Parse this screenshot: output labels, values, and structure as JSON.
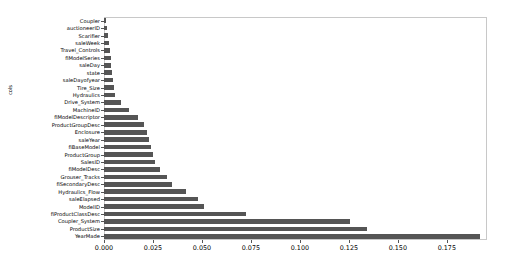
{
  "chart_data": {
    "type": "bar",
    "orientation": "horizontal",
    "title": "",
    "xlabel": "",
    "ylabel": "cols",
    "xlim": [
      0.0,
      0.1955
    ],
    "xticks": [
      0.0,
      0.025,
      0.05,
      0.075,
      0.1,
      0.125,
      0.15,
      0.175
    ],
    "xticklabels": [
      "0.000",
      "0.025",
      "0.050",
      "0.075",
      "0.100",
      "0.125",
      "0.150",
      "0.175"
    ],
    "grid": false,
    "legend": null,
    "bar_color": "#555555",
    "frame_color": "#c8c8c8",
    "categories": [
      "Coupler",
      "auctioneerID",
      "Scarifier",
      "saleWeek",
      "Travel_Controls",
      "fiModelSeries",
      "saleDay",
      "state",
      "saleDayofyear",
      "Tire_Size",
      "Hydraulics",
      "Drive_System",
      "MachineID",
      "fiModelDescriptor",
      "ProductGroupDesc",
      "Enclosure",
      "saleYear",
      "fiBaseModel",
      "ProductGroup",
      "SalesID",
      "fiModelDesc",
      "Grouser_Tracks",
      "fiSecondaryDesc",
      "Hydraulics_Flow",
      "saleElapsed",
      "ModelID",
      "fiProductClassDesc",
      "Coupler_System",
      "ProductSize",
      "YearMade"
    ],
    "values": [
      0.0012,
      0.0016,
      0.0021,
      0.0026,
      0.0031,
      0.0035,
      0.0038,
      0.0042,
      0.0046,
      0.0051,
      0.0058,
      0.0085,
      0.0128,
      0.0174,
      0.0206,
      0.0222,
      0.0232,
      0.0241,
      0.0249,
      0.0258,
      0.0286,
      0.032,
      0.0346,
      0.042,
      0.048,
      0.0509,
      0.0725,
      0.1255,
      0.134,
      0.192
    ]
  }
}
